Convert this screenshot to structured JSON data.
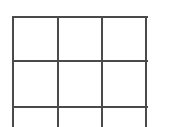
{
  "game": {
    "name": "tic-tac-toe-board",
    "line_color": "#4a4a4a",
    "background": "#ffffff",
    "rows_visible": 3,
    "columns": 3,
    "cells": [
      [
        "",
        "",
        ""
      ],
      [
        "",
        "",
        ""
      ],
      [
        "",
        "",
        ""
      ]
    ]
  }
}
